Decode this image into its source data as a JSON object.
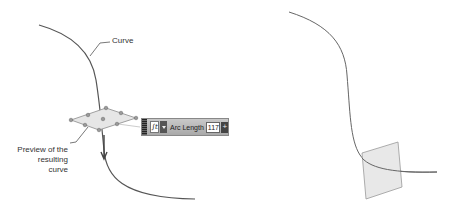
{
  "labels": {
    "curve": "Curve",
    "preview_line1": "Preview of the",
    "preview_line2": "resulting curve"
  },
  "toolbar": {
    "function_icon": "integral-icon",
    "function_glyph": "∫t",
    "dropdown_icon": "chevron-down-icon",
    "field_label": "Arc Length",
    "field_value": "117",
    "stepper_icon": "plus-icon",
    "stepper_glyph": "+"
  },
  "colors": {
    "curve": "#555555",
    "plane_fill": "#e6e6e6",
    "plane_stroke": "#8a8a8a",
    "leader": "#555555"
  }
}
